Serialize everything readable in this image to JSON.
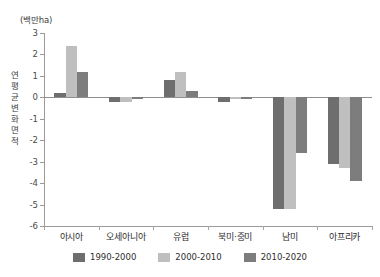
{
  "chart_data": {
    "type": "bar",
    "title": "",
    "unit_caption": "(백만ha)",
    "ylabel": "연 평균변화면적",
    "xlabel": "",
    "ylim": [
      -6,
      3
    ],
    "yticks": [
      3,
      2,
      1,
      0,
      -1,
      -2,
      -3,
      -4,
      -5,
      -6
    ],
    "ytick_labels": [
      "3",
      "2",
      "1",
      "0",
      "-1",
      "-2",
      "-3",
      "-4",
      "-5",
      "-6"
    ],
    "grid": false,
    "legend_position": "bottom-center",
    "categories": [
      "아시아",
      "오세아니아",
      "유럽",
      "북미·중미",
      "남미",
      "아프리카"
    ],
    "series": [
      {
        "name": "1990-2000",
        "color": "#6e6e6e",
        "values": [
          0.2,
          -0.2,
          0.8,
          -0.2,
          -5.2,
          -3.1
        ]
      },
      {
        "name": "2000-2010",
        "color": "#bfbfbf",
        "values": [
          2.4,
          -0.2,
          1.2,
          -0.1,
          -5.2,
          -3.3
        ]
      },
      {
        "name": "2010-2020",
        "color": "#7d7d7d",
        "values": [
          1.2,
          -0.1,
          0.3,
          -0.1,
          -2.6,
          -3.9
        ]
      }
    ],
    "colors": {
      "axis": "#9a9a9a",
      "text": "#2e2e2e",
      "background": "#ffffff"
    }
  }
}
